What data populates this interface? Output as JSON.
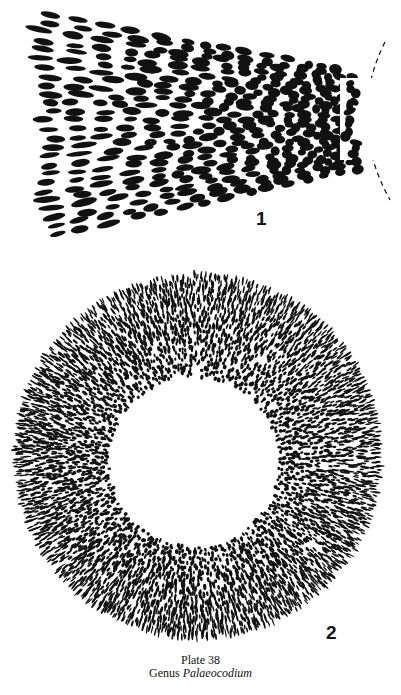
{
  "plate": {
    "title": "Plate 38",
    "genus_prefix": "Genus",
    "genus_name": "Palaeocodium"
  },
  "figures": [
    {
      "label": "1",
      "description": "Wedge-shaped longitudinal section with elongate dark filament cross-sections converging toward a dashed-outline apex at right",
      "geometry": {
        "top_left": [
          38,
          8
        ],
        "bottom_left": [
          45,
          242
        ],
        "apex_top": [
          362,
          72
        ],
        "apex_bottom": [
          368,
          168
        ],
        "dashed_arc": {
          "x_top": 385,
          "y_top": 42,
          "x_mid": 366,
          "y_mid": 120,
          "x_bottom": 390,
          "y_bottom": 200
        }
      }
    },
    {
      "label": "2",
      "description": "Circular transverse section: annulus of radially elongated dark filament cross-sections surrounding an empty central cavity",
      "geometry": {
        "center": [
          198,
          456
        ],
        "outer_rx": 185,
        "outer_ry": 184,
        "inner_center": [
          194,
          462
        ],
        "inner_r": 82
      }
    }
  ],
  "colors": {
    "ink": "#111111",
    "paper": "#ffffff"
  }
}
